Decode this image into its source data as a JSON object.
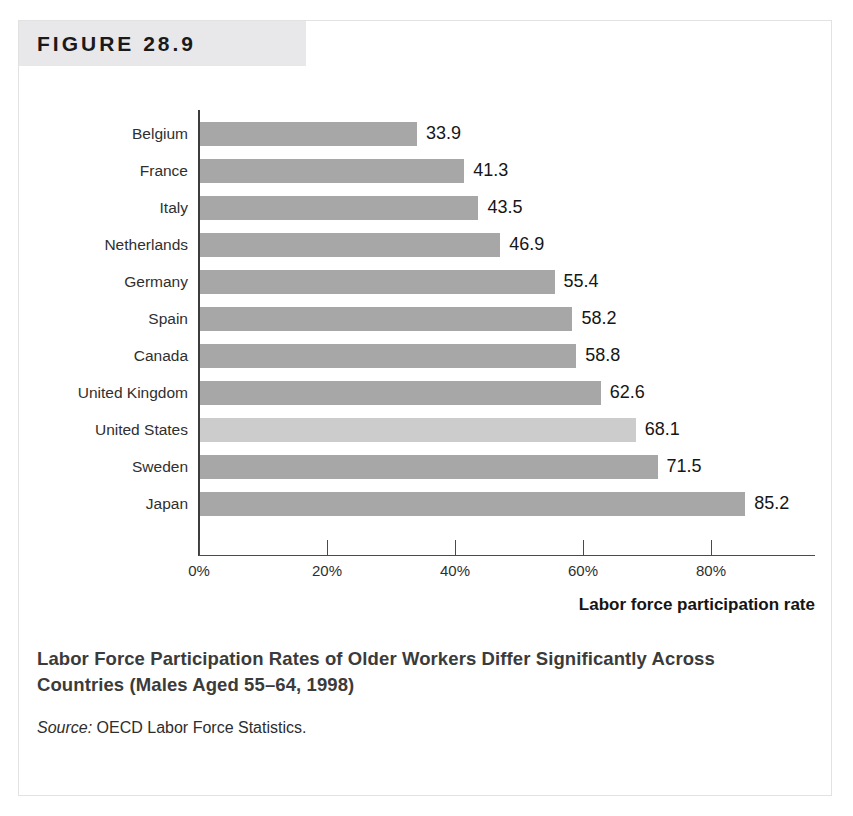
{
  "figure": {
    "header_label": "FIGURE 28.9",
    "caption_title": "Labor Force Participation Rates of Older Workers Differ Significantly Across Countries (Males Aged 55–64, 1998)",
    "source_label": "Source:",
    "source_text": "OECD Labor Force Statistics."
  },
  "colors": {
    "bar_default": "#a7a7a7",
    "bar_highlight": "#cccccc",
    "header_band": "#e8e8ea",
    "axis": "#3c3c3c",
    "frame": "#e2e2e2"
  },
  "chart_data": {
    "type": "bar",
    "orientation": "horizontal",
    "title": "Labor Force Participation Rates of Older Workers Differ Significantly Across Countries (Males Aged 55–64, 1998)",
    "xlabel": "Labor force participation rate",
    "ylabel": "",
    "xlim": [
      0,
      96
    ],
    "xticks": [
      0,
      20,
      40,
      60,
      80
    ],
    "xticklabels": [
      "0%",
      "20%",
      "40%",
      "60%",
      "80%"
    ],
    "grid": false,
    "legend": null,
    "value_labels": true,
    "categories": [
      "Belgium",
      "France",
      "Italy",
      "Netherlands",
      "Germany",
      "Spain",
      "Canada",
      "United Kingdom",
      "United States",
      "Sweden",
      "Japan"
    ],
    "values": [
      33.9,
      41.3,
      43.5,
      46.9,
      55.4,
      58.2,
      58.8,
      62.6,
      68.1,
      71.5,
      85.2
    ],
    "value_label_texts": [
      "33.9",
      "41.3",
      "43.5",
      "46.9",
      "55.4",
      "58.2",
      "58.8",
      "62.6",
      "68.1",
      "71.5",
      "85.2"
    ],
    "highlighted_category": "United States",
    "bars": [
      {
        "label": "Belgium",
        "value": 33.9,
        "text": "33.9",
        "highlight": false
      },
      {
        "label": "France",
        "value": 41.3,
        "text": "41.3",
        "highlight": false
      },
      {
        "label": "Italy",
        "value": 43.5,
        "text": "43.5",
        "highlight": false
      },
      {
        "label": "Netherlands",
        "value": 46.9,
        "text": "46.9",
        "highlight": false
      },
      {
        "label": "Germany",
        "value": 55.4,
        "text": "55.4",
        "highlight": false
      },
      {
        "label": "Spain",
        "value": 58.2,
        "text": "58.2",
        "highlight": false
      },
      {
        "label": "Canada",
        "value": 58.8,
        "text": "58.8",
        "highlight": false
      },
      {
        "label": "United Kingdom",
        "value": 62.6,
        "text": "62.6",
        "highlight": false
      },
      {
        "label": "United States",
        "value": 68.1,
        "text": "68.1",
        "highlight": true
      },
      {
        "label": "Sweden",
        "value": 71.5,
        "text": "71.5",
        "highlight": false
      },
      {
        "label": "Japan",
        "value": 85.2,
        "text": "85.2",
        "highlight": false
      }
    ]
  }
}
